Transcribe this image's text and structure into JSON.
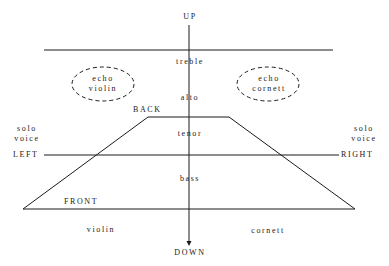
{
  "diagram": {
    "axes": {
      "up": "UP",
      "down": "DOWN",
      "left": "LEFT",
      "right": "RIGHT",
      "back": "BACK",
      "front": "FRONT"
    },
    "registers": {
      "treble": "treble",
      "alto": "alto",
      "tenor": "tenor",
      "bass": "bass"
    },
    "echo_left": {
      "line1": "echo",
      "line2": "violin"
    },
    "echo_right": {
      "line1": "echo",
      "line2": "cornett"
    },
    "solo_left": {
      "line1": "solo",
      "line2": "voice"
    },
    "solo_right": {
      "line1": "solo",
      "line2": "voice"
    },
    "instruments": {
      "left": "violin",
      "right": "cornett"
    },
    "colors": {
      "line": "#1a1a1a",
      "background": "#ffffff"
    }
  }
}
